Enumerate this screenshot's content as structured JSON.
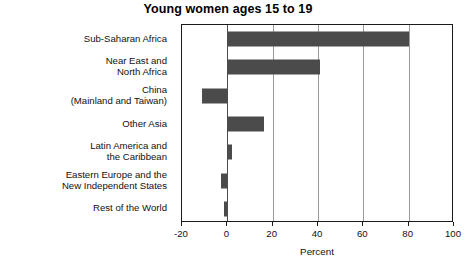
{
  "chart_data": {
    "type": "bar",
    "orientation": "horizontal",
    "title": "Young women ages 15 to 19",
    "xlabel": "Percent",
    "ylabel": "",
    "xlim": [
      -20,
      100
    ],
    "xticks": [
      -20,
      0,
      20,
      40,
      60,
      80,
      100
    ],
    "xtick_labels": [
      "-20",
      "0",
      "20",
      "40",
      "60",
      "80",
      "100"
    ],
    "grid": true,
    "legend": null,
    "bar_color": "#4b4b4b",
    "categories": [
      "Sub-Saharan Africa",
      "Near East and\nNorth Africa",
      "China\n(Mainland and Taiwan)",
      "Other Asia",
      "Latin America and\nthe Caribbean",
      "Eastern Europe and the\nNew Independent States",
      "Rest of the World"
    ],
    "category_lines": [
      [
        "Sub-Saharan Africa"
      ],
      [
        "Near East and",
        "North Africa"
      ],
      [
        "China",
        "(Mainland and Taiwan)"
      ],
      [
        "Other Asia"
      ],
      [
        "Latin America and",
        "the Caribbean"
      ],
      [
        "Eastern Europe and the",
        "New Independent States"
      ],
      [
        "Rest of the World"
      ]
    ],
    "values": [
      80,
      41,
      -11,
      16,
      2,
      -3,
      -1.5
    ]
  }
}
